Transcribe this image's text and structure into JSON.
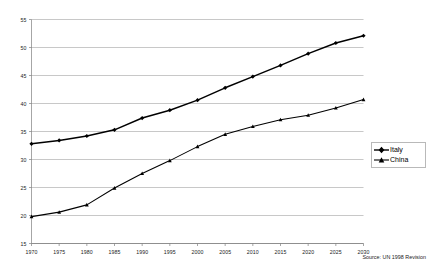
{
  "chart_data": {
    "type": "line",
    "title": "",
    "subtitle": "",
    "xlabel": "",
    "ylabel": "",
    "x": [
      1970,
      1975,
      1980,
      1985,
      1990,
      1995,
      2000,
      2005,
      2010,
      2015,
      2020,
      2025,
      2030
    ],
    "xtick_labels": [
      "1970",
      "1975",
      "1980",
      "1985",
      "1990",
      "1995",
      "2000",
      "2005",
      "2010",
      "2015",
      "2020",
      "2025",
      "2030"
    ],
    "ytick_labels": [
      "15",
      "20",
      "25",
      "30",
      "35",
      "40",
      "45",
      "50",
      "55"
    ],
    "ytick_values": [
      15,
      20,
      25,
      30,
      35,
      40,
      45,
      50,
      55
    ],
    "xlim": [
      1970,
      2030
    ],
    "ylim": [
      15,
      55
    ],
    "grid": "horizontal",
    "legend_position": "right",
    "series": [
      {
        "name": "Italy",
        "marker": "diamond",
        "color": "#000000",
        "values": [
          32.8,
          33.4,
          34.2,
          35.3,
          37.4,
          38.8,
          40.6,
          42.8,
          44.8,
          46.8,
          48.9,
          50.8,
          52.1
        ]
      },
      {
        "name": "China",
        "marker": "triangle",
        "color": "#000000",
        "values": [
          19.8,
          20.6,
          21.9,
          24.9,
          27.5,
          29.8,
          32.3,
          34.5,
          35.9,
          37.1,
          37.9,
          39.2,
          40.7
        ]
      }
    ],
    "annotations": [
      {
        "id": "source",
        "text": "Source: UN 1998 Revision"
      }
    ]
  },
  "legend": {
    "items": [
      {
        "label": "Italy"
      },
      {
        "label": "China"
      }
    ]
  },
  "footer": {
    "source_text": "Source: UN 1998 Revision"
  },
  "colors": {
    "series": "#000000",
    "grid": "#b0b0b0",
    "axis": "#808080",
    "legend_border": "#b9b9b9",
    "background": "#ffffff"
  }
}
